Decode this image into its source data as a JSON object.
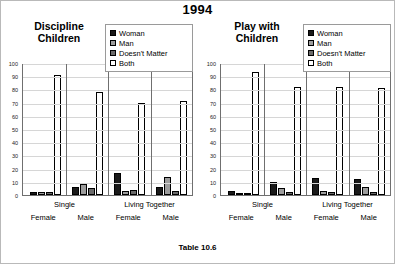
{
  "page": {
    "title": "1994",
    "table_caption": "Table 10.6"
  },
  "legend": {
    "items": [
      {
        "label": "Woman",
        "color": "#1a1a1a"
      },
      {
        "label": "Man",
        "color": "#9d9d9d"
      },
      {
        "label": "Doesn't  Matter",
        "color": "#6b6b6b"
      },
      {
        "label": "Both",
        "color": "#ffffff"
      }
    ]
  },
  "axis": {
    "ticks": [
      "100",
      "90",
      "80",
      "70",
      "60",
      "50",
      "40",
      "30",
      "20",
      "10",
      "0"
    ],
    "ymin": 0,
    "ymax": 100
  },
  "categories": {
    "top": [
      "Single",
      "Living Together"
    ],
    "bottom": [
      "Female",
      "Male",
      "Female",
      "Male"
    ]
  },
  "chart_data": [
    {
      "type": "bar",
      "title": "Discipline Children",
      "xlabel": "",
      "ylabel": "",
      "ylim": [
        0,
        100
      ],
      "grid": true,
      "legend_position": "top-right",
      "categories": [
        "Single Female",
        "Single Male",
        "Living Together Female",
        "Living Together Male"
      ],
      "series": [
        {
          "name": "Woman",
          "values": [
            2,
            6,
            17,
            6
          ]
        },
        {
          "name": "Man",
          "values": [
            2,
            8,
            3,
            14
          ]
        },
        {
          "name": "Doesn't  Matter",
          "values": [
            2,
            5,
            4,
            3
          ]
        },
        {
          "name": "Both",
          "values": [
            91,
            78,
            70,
            71
          ]
        }
      ]
    },
    {
      "type": "bar",
      "title": "Play with Children",
      "xlabel": "",
      "ylabel": "",
      "ylim": [
        0,
        100
      ],
      "grid": true,
      "legend_position": "top-right",
      "categories": [
        "Single Female",
        "Single Male",
        "Living Together Female",
        "Living Together Male"
      ],
      "series": [
        {
          "name": "Woman",
          "values": [
            3,
            10,
            13,
            12
          ]
        },
        {
          "name": "Man",
          "values": [
            1,
            5,
            3,
            6
          ]
        },
        {
          "name": "Doesn't  Matter",
          "values": [
            1,
            2,
            2,
            2
          ]
        },
        {
          "name": "Both",
          "values": [
            93,
            82,
            82,
            81
          ]
        }
      ]
    }
  ]
}
